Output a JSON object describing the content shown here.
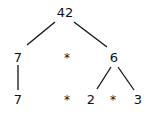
{
  "tree": {
    "root": {
      "label": "42"
    },
    "level1": [
      {
        "label": "7"
      },
      {
        "label": "*"
      },
      {
        "label": "6"
      }
    ],
    "level2": [
      {
        "label": "7"
      },
      {
        "label": "*"
      },
      {
        "label": "2"
      },
      {
        "label": "*"
      },
      {
        "label": "3"
      }
    ],
    "edges": [
      [
        "42",
        "7"
      ],
      [
        "42",
        "6"
      ],
      [
        "7",
        "7"
      ],
      [
        "6",
        "2"
      ],
      [
        "6",
        "3"
      ]
    ]
  },
  "colors": {
    "line": "#111111",
    "text": "#111111",
    "background": "#ffffff"
  }
}
